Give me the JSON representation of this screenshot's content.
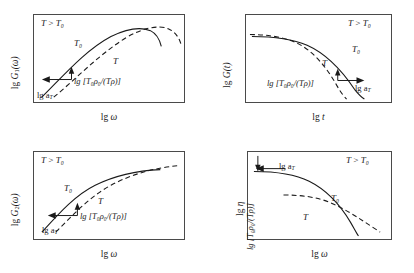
{
  "figure": {
    "panels": [
      {
        "id": "panel-1",
        "ylabel_prefix": "lg",
        "ylabel_symbol": "G",
        "ylabel_sub": "1",
        "ylabel_arg": "(ω)",
        "xlabel_prefix": "lg",
        "xlabel_symbol": "ω",
        "condition": "T > T₀",
        "curve_label_solid": "T₀",
        "curve_label_dashed": "T",
        "annotation_shift": "lg [T₀ρ₀/(Tρ)]",
        "annotation_at": "lg a",
        "annotation_at_sub": "T",
        "curve_shape": "rises, peaks near right, then falls"
      },
      {
        "id": "panel-2",
        "ylabel_prefix": "lg",
        "ylabel_symbol": "G",
        "ylabel_sub": "",
        "ylabel_arg": "(t)",
        "xlabel_prefix": "lg",
        "xlabel_symbol": "t",
        "condition": "T > T₀",
        "curve_label_solid": "T₀",
        "curve_label_dashed": "T",
        "annotation_shift": "lg [T₀ρ₀/(Tρ)]",
        "annotation_at": "lg a",
        "annotation_at_sub": "T",
        "curve_shape": "plateau at left then steep decay to the right"
      },
      {
        "id": "panel-3",
        "ylabel_prefix": "lg",
        "ylabel_symbol": "G",
        "ylabel_sub": "2",
        "ylabel_arg": "(ω)",
        "xlabel_prefix": "lg",
        "xlabel_symbol": "ω",
        "condition": "T > T₀",
        "curve_label_solid": "T₀",
        "curve_label_dashed": "T",
        "annotation_shift": "lg [T₀ρ₀/(Tρ)]",
        "annotation_at": "lg a",
        "annotation_at_sub": "T",
        "curve_shape": "rises then levels off to a plateau"
      },
      {
        "id": "panel-4",
        "ylabel_prefix": "lg",
        "ylabel_symbol": "η",
        "ylabel_sub": "",
        "ylabel_arg": "",
        "xlabel_prefix": "lg",
        "xlabel_symbol": "ω",
        "condition": "T > T₀",
        "curve_label_solid": "T₀",
        "curve_label_dashed": "T",
        "annotation_shift": "lg [T₀ρ₀/(Tρ)]",
        "annotation_at": "lg a",
        "annotation_at_sub": "T",
        "curve_shape": "plateau at left then decreasing; curves cross at lower right"
      }
    ],
    "style": {
      "frame_color": "#4a4a4a",
      "curve_color": "#1a1a1a",
      "background": "#ffffff"
    }
  }
}
